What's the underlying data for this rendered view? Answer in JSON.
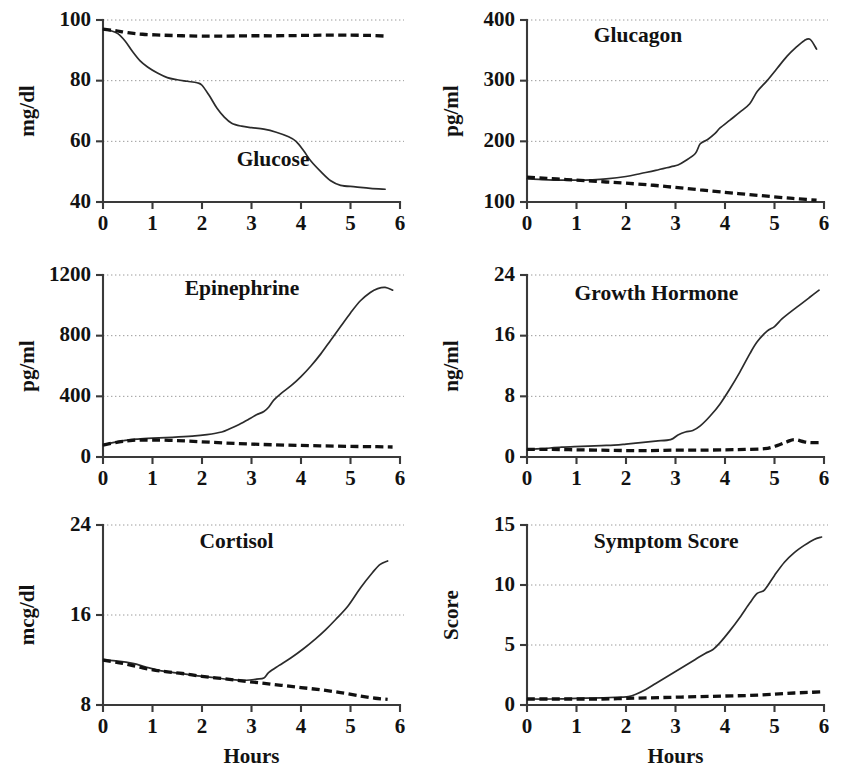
{
  "figure": {
    "shared_xlabel": "Hours",
    "legend_note_solid": "solid line",
    "legend_note_dashed": "dashed line"
  },
  "chart_data": [
    {
      "type": "line",
      "title": "Glucose",
      "xlabel": "",
      "ylabel": "mg/dl",
      "xlim": [
        0,
        6
      ],
      "ylim": [
        40,
        100
      ],
      "xticks": [
        0,
        1,
        2,
        3,
        4,
        5,
        6
      ],
      "yticks": [
        40,
        60,
        80,
        100
      ],
      "grid": true,
      "series": [
        {
          "name": "solid",
          "style": "solid",
          "x": [
            0,
            0.15,
            0.3,
            0.45,
            0.6,
            0.75,
            0.9,
            1.1,
            1.3,
            1.5,
            1.7,
            1.9,
            2.0,
            2.15,
            2.3,
            2.45,
            2.6,
            2.8,
            3.0,
            3.25,
            3.5,
            3.75,
            3.9,
            4.05,
            4.2,
            4.4,
            4.6,
            4.8,
            5.1,
            5.4,
            5.7
          ],
          "y": [
            97,
            96.5,
            95.5,
            93,
            89.5,
            86.5,
            84.5,
            82.5,
            81,
            80.3,
            79.8,
            79.3,
            78.5,
            75,
            71,
            68,
            66,
            65,
            64.5,
            64,
            63,
            61.5,
            60,
            57,
            53.5,
            50,
            47,
            45.5,
            45,
            44.5,
            44.2
          ]
        },
        {
          "name": "dashed",
          "style": "dashed",
          "x": [
            0,
            0.25,
            0.5,
            0.8,
            1.2,
            1.6,
            2.0,
            2.5,
            3.0,
            3.5,
            4.0,
            4.5,
            5.0,
            5.4,
            5.7
          ],
          "y": [
            97,
            96.5,
            95.8,
            95.3,
            95.0,
            94.8,
            94.7,
            94.7,
            94.8,
            94.8,
            94.9,
            95.0,
            95.0,
            94.9,
            94.7
          ]
        }
      ]
    },
    {
      "type": "line",
      "title": "Glucagon",
      "xlabel": "",
      "ylabel": "pg/ml",
      "xlim": [
        0,
        6
      ],
      "ylim": [
        100,
        400
      ],
      "xticks": [
        0,
        1,
        2,
        3,
        4,
        5,
        6
      ],
      "yticks": [
        100,
        200,
        300,
        400
      ],
      "grid": true,
      "series": [
        {
          "name": "solid",
          "style": "solid",
          "x": [
            0,
            0.3,
            0.7,
            1.0,
            1.3,
            1.6,
            2.0,
            2.3,
            2.6,
            2.9,
            3.05,
            3.2,
            3.4,
            3.5,
            3.65,
            3.8,
            3.9,
            4.1,
            4.3,
            4.5,
            4.65,
            4.85,
            5.05,
            5.25,
            5.45,
            5.6,
            5.72,
            5.85
          ],
          "y": [
            138,
            137,
            136,
            136,
            136.5,
            138,
            142,
            147,
            152,
            158,
            161,
            168,
            180,
            196,
            203,
            213,
            222,
            235,
            248,
            262,
            282,
            300,
            320,
            340,
            356,
            366,
            368,
            352
          ]
        },
        {
          "name": "dashed",
          "style": "dashed",
          "x": [
            0,
            0.4,
            0.8,
            1.2,
            1.6,
            2.0,
            2.5,
            3.0,
            3.5,
            4.0,
            4.4,
            4.8,
            5.2,
            5.5,
            5.85
          ],
          "y": [
            141,
            139,
            137,
            135,
            133,
            131,
            128,
            124,
            120,
            116,
            113,
            110,
            107,
            105,
            103
          ]
        }
      ]
    },
    {
      "type": "line",
      "title": "Epinephrine",
      "xlabel": "",
      "ylabel": "pg/ml",
      "xlim": [
        0,
        6
      ],
      "ylim": [
        0,
        1200
      ],
      "xticks": [
        0,
        1,
        2,
        3,
        4,
        5,
        6
      ],
      "yticks": [
        0,
        400,
        800,
        1200
      ],
      "grid": true,
      "series": [
        {
          "name": "solid",
          "style": "solid",
          "x": [
            0,
            0.2,
            0.45,
            0.7,
            1.0,
            1.4,
            1.8,
            2.1,
            2.4,
            2.55,
            2.75,
            2.95,
            3.1,
            3.25,
            3.35,
            3.45,
            3.6,
            3.8,
            4.0,
            4.2,
            4.4,
            4.6,
            4.8,
            5.0,
            5.2,
            5.4,
            5.55,
            5.7,
            5.85
          ],
          "y": [
            78,
            95,
            110,
            118,
            124,
            130,
            138,
            148,
            165,
            185,
            215,
            250,
            278,
            300,
            330,
            375,
            420,
            470,
            530,
            600,
            680,
            770,
            860,
            950,
            1030,
            1085,
            1110,
            1118,
            1100
          ]
        },
        {
          "name": "dashed",
          "style": "dashed",
          "x": [
            0,
            0.3,
            0.6,
            1.0,
            1.5,
            2.0,
            2.5,
            3.0,
            3.5,
            4.0,
            4.5,
            5.0,
            5.5,
            5.85
          ],
          "y": [
            78,
            98,
            110,
            112,
            108,
            100,
            92,
            85,
            80,
            76,
            73,
            70,
            68,
            66
          ]
        }
      ]
    },
    {
      "type": "line",
      "title": "Growth Hormone",
      "xlabel": "",
      "ylabel": "ng/ml",
      "xlim": [
        0,
        6
      ],
      "ylim": [
        0,
        24
      ],
      "xticks": [
        0,
        1,
        2,
        3,
        4,
        5,
        6
      ],
      "yticks": [
        0,
        8,
        16,
        24
      ],
      "grid": true,
      "series": [
        {
          "name": "solid",
          "style": "solid",
          "x": [
            0,
            0.3,
            0.7,
            1.1,
            1.5,
            1.85,
            2.0,
            2.3,
            2.6,
            2.9,
            3.05,
            3.2,
            3.35,
            3.5,
            3.7,
            3.9,
            4.1,
            4.3,
            4.5,
            4.65,
            4.85,
            5.0,
            5.15,
            5.3,
            5.5,
            5.7,
            5.9
          ],
          "y": [
            1.0,
            1.1,
            1.3,
            1.4,
            1.5,
            1.6,
            1.7,
            1.9,
            2.1,
            2.3,
            2.9,
            3.3,
            3.5,
            4.1,
            5.4,
            7.0,
            9.0,
            11.2,
            13.6,
            15.2,
            16.6,
            17.2,
            18.2,
            19.0,
            20.0,
            21.0,
            22.0
          ]
        },
        {
          "name": "dashed",
          "style": "dashed",
          "x": [
            0,
            0.5,
            1.0,
            1.5,
            2.0,
            2.5,
            3.0,
            3.5,
            4.0,
            4.4,
            4.8,
            5.05,
            5.25,
            5.4,
            5.6,
            5.75,
            5.9
          ],
          "y": [
            1.0,
            1.0,
            0.95,
            0.9,
            0.85,
            0.85,
            0.9,
            0.9,
            0.95,
            1.0,
            1.1,
            1.5,
            2.0,
            2.3,
            2.0,
            1.9,
            1.9
          ]
        }
      ]
    },
    {
      "type": "line",
      "title": "Cortisol",
      "xlabel": "Hours",
      "ylabel": "mcg/dl",
      "xlim": [
        0,
        6
      ],
      "ylim": [
        8,
        24
      ],
      "xticks": [
        0,
        1,
        2,
        3,
        4,
        5,
        6
      ],
      "yticks": [
        8,
        16,
        24
      ],
      "grid": true,
      "series": [
        {
          "name": "solid",
          "style": "solid",
          "x": [
            0,
            0.3,
            0.6,
            0.85,
            1.1,
            1.4,
            1.8,
            2.2,
            2.6,
            2.9,
            3.1,
            3.25,
            3.35,
            3.55,
            3.8,
            4.05,
            4.3,
            4.5,
            4.7,
            4.95,
            5.2,
            5.45,
            5.6,
            5.75
          ],
          "y": [
            12.0,
            11.9,
            11.7,
            11.4,
            11.1,
            10.9,
            10.65,
            10.45,
            10.25,
            10.2,
            10.3,
            10.4,
            10.9,
            11.5,
            12.2,
            13.0,
            13.9,
            14.7,
            15.6,
            16.8,
            18.4,
            19.8,
            20.5,
            20.8
          ]
        },
        {
          "name": "dashed",
          "style": "dashed",
          "x": [
            0,
            0.4,
            0.8,
            1.2,
            1.6,
            2.0,
            2.4,
            2.8,
            3.2,
            3.6,
            4.0,
            4.4,
            4.8,
            5.2,
            5.5,
            5.75
          ],
          "y": [
            12.0,
            11.7,
            11.3,
            11.0,
            10.8,
            10.55,
            10.35,
            10.15,
            9.95,
            9.75,
            9.55,
            9.35,
            9.1,
            8.8,
            8.6,
            8.5
          ]
        }
      ]
    },
    {
      "type": "line",
      "title": "Symptom Score",
      "xlabel": "Hours",
      "ylabel": "Score",
      "xlim": [
        0,
        6
      ],
      "ylim": [
        0,
        15
      ],
      "xticks": [
        0,
        1,
        2,
        3,
        4,
        5,
        6
      ],
      "yticks": [
        0,
        5,
        10,
        15
      ],
      "grid": true,
      "series": [
        {
          "name": "solid",
          "style": "solid",
          "x": [
            0,
            0.5,
            1.0,
            1.5,
            1.9,
            2.05,
            2.2,
            2.4,
            2.6,
            2.8,
            3.0,
            3.2,
            3.4,
            3.6,
            3.75,
            3.9,
            4.1,
            4.3,
            4.5,
            4.65,
            4.8,
            5.0,
            5.2,
            5.4,
            5.6,
            5.8,
            5.95
          ],
          "y": [
            0.5,
            0.5,
            0.55,
            0.6,
            0.65,
            0.7,
            0.9,
            1.3,
            1.8,
            2.3,
            2.8,
            3.3,
            3.8,
            4.3,
            4.6,
            5.2,
            6.2,
            7.3,
            8.5,
            9.3,
            9.6,
            10.8,
            11.9,
            12.7,
            13.3,
            13.8,
            14.0
          ]
        },
        {
          "name": "dashed",
          "style": "dashed",
          "x": [
            0,
            0.5,
            1.0,
            1.5,
            2.0,
            2.5,
            3.0,
            3.5,
            4.0,
            4.5,
            5.0,
            5.4,
            5.7,
            5.95
          ],
          "y": [
            0.5,
            0.5,
            0.5,
            0.5,
            0.55,
            0.6,
            0.65,
            0.7,
            0.75,
            0.8,
            0.9,
            1.0,
            1.05,
            1.1
          ]
        }
      ]
    }
  ],
  "panel_layout": [
    {
      "left": 0,
      "top": 0,
      "title_x": 0.9,
      "title_y_frac": 0.8
    },
    {
      "left": 424,
      "top": 0,
      "title_x": 0.45,
      "title_y_frac": 0.12
    },
    {
      "left": 0,
      "top": 255,
      "title_x": 0.55,
      "title_y_frac": 0.11
    },
    {
      "left": 424,
      "top": 255,
      "title_x": 0.32,
      "title_y_frac": 0.14
    },
    {
      "left": 0,
      "top": 505,
      "title_x": 0.65,
      "title_y_frac": 0.13
    },
    {
      "left": 424,
      "top": 505,
      "title_x": 0.45,
      "title_y_frac": 0.13
    }
  ]
}
